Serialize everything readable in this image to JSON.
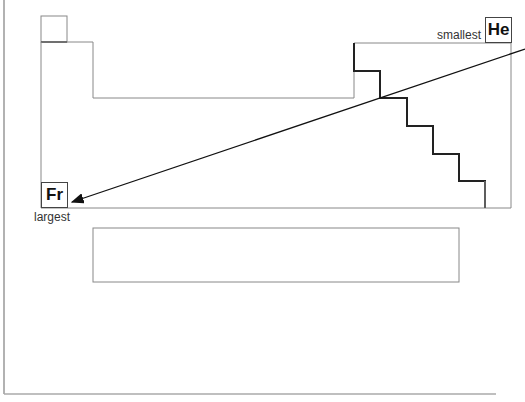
{
  "diagram": {
    "labels": {
      "smallest": "smallest",
      "largest": "largest"
    },
    "elements": {
      "top_right": "He",
      "bottom_left": "Fr"
    },
    "arrow": {
      "from": "He",
      "to": "Fr",
      "meaning": "atomic size increases toward bottom-left"
    },
    "colors": {
      "outline": "#888888",
      "staircase": "#222222",
      "arrow": "#111111"
    }
  }
}
